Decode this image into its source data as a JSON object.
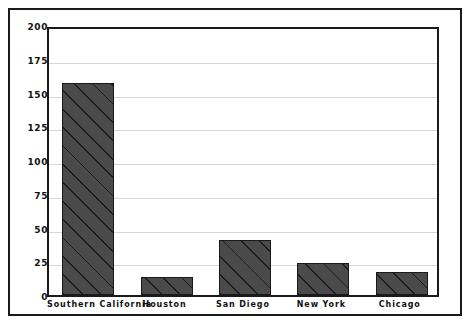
{
  "chart_data": {
    "type": "bar",
    "title": "",
    "xlabel": "",
    "ylabel": "",
    "ylim": [
      0,
      200
    ],
    "yticks": [
      0,
      25,
      50,
      75,
      100,
      125,
      150,
      175,
      200
    ],
    "grid": true,
    "legend": "none",
    "categories": [
      "Southern California",
      "Houston",
      "San Diego",
      "New York",
      "Chicago"
    ],
    "values": [
      157,
      13,
      41,
      24,
      17
    ],
    "series": [
      {
        "name": "",
        "values": [
          157,
          13,
          41,
          24,
          17
        ]
      }
    ],
    "style": {
      "bar_fill": "#4a4a4a",
      "bar_hatch": "diagonal",
      "bar_edge": "#1a1a1a",
      "gridline_color": "#d6d6d6",
      "axis_color": "#1a1a1a",
      "background": "#ffffff"
    }
  }
}
